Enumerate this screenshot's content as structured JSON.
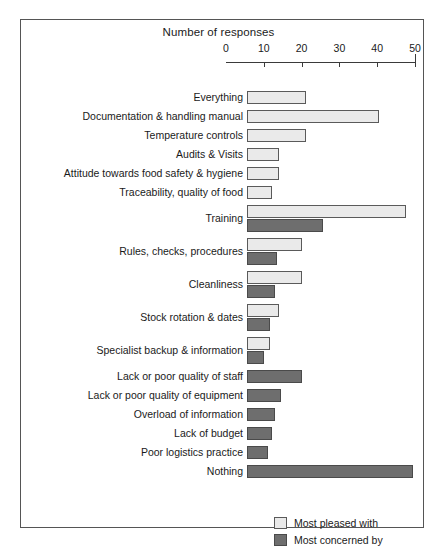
{
  "chart_data": {
    "type": "bar",
    "orientation": "horizontal",
    "title": "",
    "xlabel": "Number of responses",
    "ylabel": "",
    "xlim": [
      0,
      50
    ],
    "xticks": [
      0,
      10,
      20,
      30,
      40,
      50
    ],
    "xtick_labels": [
      "0",
      "10",
      "20",
      "30",
      "40",
      "50"
    ],
    "grid": false,
    "legend_position": "bottom-right",
    "categories": [
      "Everything",
      "Documentation & handling manual",
      "Temperature controls",
      "Audits & Visits",
      "Attitude towards food safety & hygiene",
      "Traceability, quality of food",
      "Training",
      "Rules, checks, procedures",
      "Cleanliness",
      "Stock rotation & dates",
      "Specialist backup & information",
      "Lack or poor quality of staff",
      "Lack or poor quality of equipment",
      "Overload of information",
      "Lack of budget",
      "Poor logistics practice",
      "Nothing"
    ],
    "series": [
      {
        "name": "Most pleased with",
        "color": "#eaeaea",
        "values": [
          15.5,
          35,
          15.5,
          8.5,
          8.5,
          6.5,
          42,
          14.5,
          14.5,
          8.5,
          6,
          null,
          null,
          null,
          null,
          null,
          null
        ]
      },
      {
        "name": "Most concerned by",
        "color": "#6e6e6e",
        "values": [
          null,
          null,
          null,
          null,
          null,
          null,
          20,
          8,
          7.5,
          6,
          4.5,
          14.5,
          9,
          7.5,
          6.5,
          5.5,
          44
        ]
      }
    ]
  },
  "legend": {
    "items": [
      {
        "label": "Most pleased with",
        "swatch": "light"
      },
      {
        "label": "Most concerned by",
        "swatch": "dark"
      }
    ]
  }
}
